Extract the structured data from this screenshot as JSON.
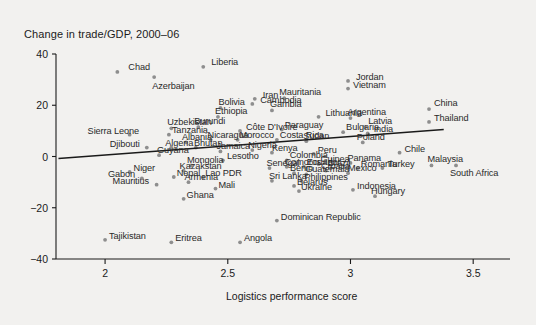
{
  "chart_data": {
    "type": "scatter",
    "title": "Change in trade/GDP, 2000–06",
    "xlabel": "Logistics performance score",
    "ylabel": "Change in trade/GDP, 2000–06",
    "xlim": [
      1.8,
      3.65
    ],
    "ylim": [
      -40,
      40
    ],
    "grid": false,
    "legend": null,
    "xticks": [
      "2",
      "2.5",
      "3",
      "3.5"
    ],
    "xtick_values": [
      2,
      2.5,
      3,
      3.5
    ],
    "yticks": [
      "40",
      "20",
      "0",
      "−20",
      "−40"
    ],
    "ytick_values": [
      40,
      20,
      0,
      -20,
      -40
    ],
    "marker_color": "#8e8e8e",
    "trendline": {
      "x0": 1.81,
      "y0": -0.8,
      "x1": 3.38,
      "y1": 10.5,
      "color": "#1a1a1a"
    },
    "points": [
      {
        "label": "Chad",
        "x": 2.05,
        "y": 33.0,
        "lx": 11,
        "ly": -5
      },
      {
        "label": "Azerbaijan",
        "x": 2.2,
        "y": 31.0,
        "lx": -2,
        "ly": 9
      },
      {
        "label": "Liberia",
        "x": 2.4,
        "y": 35.0,
        "lx": 8,
        "ly": -5
      },
      {
        "label": "Iran",
        "x": 2.61,
        "y": 22.5,
        "lx": 8,
        "ly": -4
      },
      {
        "label": "Mauritania",
        "x": 2.73,
        "y": 22.8,
        "lx": -5,
        "ly": -6
      },
      {
        "label": "Cambodia",
        "x": 2.6,
        "y": 20.5,
        "lx": 8,
        "ly": -4
      },
      {
        "label": "Jordan",
        "x": 2.99,
        "y": 29.5,
        "lx": 8,
        "ly": -4
      },
      {
        "label": "Vietnam",
        "x": 2.99,
        "y": 26.5,
        "lx": 5,
        "ly": -4
      },
      {
        "label": "Bolivia",
        "x": 2.47,
        "y": 19.0,
        "lx": -2,
        "ly": -6
      },
      {
        "label": "Gambia",
        "x": 2.68,
        "y": 18.0,
        "lx": -2,
        "ly": -6
      },
      {
        "label": "Ethiopia",
        "x": 2.46,
        "y": 15.5,
        "lx": -3,
        "ly": -6
      },
      {
        "label": "Lithuania",
        "x": 2.87,
        "y": 15.5,
        "lx": 7,
        "ly": -4
      },
      {
        "label": "Argentina",
        "x": 3.0,
        "y": 15.0,
        "lx": -3,
        "ly": -6
      },
      {
        "label": "China",
        "x": 3.32,
        "y": 18.5,
        "lx": 5,
        "ly": -6
      },
      {
        "label": "Thailand",
        "x": 3.32,
        "y": 13.5,
        "lx": 5,
        "ly": -4
      },
      {
        "label": "Latvia",
        "x": 3.06,
        "y": 11.5,
        "lx": 3,
        "ly": -6
      },
      {
        "label": "Uzbekistan",
        "x": 2.27,
        "y": 11.0,
        "lx": -4,
        "ly": -6
      },
      {
        "label": "Burundi",
        "x": 2.38,
        "y": 11.5,
        "lx": -4,
        "ly": -6
      },
      {
        "label": "Côte D'Ivoire",
        "x": 2.55,
        "y": 10.0,
        "lx": 6,
        "ly": -4
      },
      {
        "label": "Paraguay",
        "x": 2.72,
        "y": 10.5,
        "lx": 3,
        "ly": -5
      },
      {
        "label": "Bulgaria",
        "x": 2.97,
        "y": 9.5,
        "lx": 3,
        "ly": -5
      },
      {
        "label": "India",
        "x": 3.07,
        "y": 9.0,
        "lx": 6,
        "ly": -4
      },
      {
        "label": "Sierra Leone",
        "x": 2.1,
        "y": 8.5,
        "lx": -42,
        "ly": -4
      },
      {
        "label": "Tanzania",
        "x": 2.26,
        "y": 8.5,
        "lx": 3,
        "ly": -5
      },
      {
        "label": "Nicaragua",
        "x": 2.43,
        "y": 6.5,
        "lx": -3,
        "ly": -5
      },
      {
        "label": "Morocco",
        "x": 2.54,
        "y": 6.5,
        "lx": 2,
        "ly": -5
      },
      {
        "label": "Costa Rica",
        "x": 2.7,
        "y": 6.5,
        "lx": 3,
        "ly": -5
      },
      {
        "label": "Sudan",
        "x": 2.82,
        "y": 6.0,
        "lx": -3,
        "ly": -5
      },
      {
        "label": "Poland",
        "x": 3.05,
        "y": 5.5,
        "lx": -6,
        "ly": -5
      },
      {
        "label": "Albania",
        "x": 2.33,
        "y": 5.5,
        "lx": -4,
        "ly": -5
      },
      {
        "label": "Algeria",
        "x": 2.27,
        "y": 3.5,
        "lx": -6,
        "ly": -5
      },
      {
        "label": "Bhutan",
        "x": 2.37,
        "y": 3.5,
        "lx": -2,
        "ly": -5
      },
      {
        "label": "Djibouti",
        "x": 2.17,
        "y": 3.5,
        "lx": -37,
        "ly": -4
      },
      {
        "label": "Jamaica",
        "x": 2.47,
        "y": 2.0,
        "lx": -4,
        "ly": -5
      },
      {
        "label": "Nigeria",
        "x": 2.6,
        "y": 2.5,
        "lx": -4,
        "ly": -5
      },
      {
        "label": "Kenya",
        "x": 2.68,
        "y": 1.5,
        "lx": 0,
        "ly": -5
      },
      {
        "label": "Peru",
        "x": 2.85,
        "y": 1.0,
        "lx": 4,
        "ly": -4
      },
      {
        "label": "Chile",
        "x": 3.2,
        "y": 1.5,
        "lx": 5,
        "ly": -4
      },
      {
        "label": "Guyana",
        "x": 2.22,
        "y": 0.5,
        "lx": -2,
        "ly": -5
      },
      {
        "label": "Lesotho",
        "x": 2.48,
        "y": -1.5,
        "lx": 4,
        "ly": -4
      },
      {
        "label": "Colombia",
        "x": 2.74,
        "y": -1.5,
        "lx": 3,
        "ly": -5
      },
      {
        "label": "Panama",
        "x": 3.0,
        "y": -2.5,
        "lx": -3,
        "ly": -5
      },
      {
        "label": "Guinea",
        "x": 2.87,
        "y": -3.0,
        "lx": 2,
        "ly": -5
      },
      {
        "label": "Brazil",
        "x": 2.92,
        "y": -4.5,
        "lx": -3,
        "ly": -5
      },
      {
        "label": "Romania",
        "x": 3.03,
        "y": -4.5,
        "lx": 3,
        "ly": -4
      },
      {
        "label": "Turkey",
        "x": 3.13,
        "y": -4.5,
        "lx": 5,
        "ly": -4
      },
      {
        "label": "Malaysia",
        "x": 3.33,
        "y": -3.5,
        "lx": -4,
        "ly": -6
      },
      {
        "label": "South Africa",
        "x": 3.43,
        "y": -3.5,
        "lx": -6,
        "ly": 8
      },
      {
        "label": "Mongolia",
        "x": 2.35,
        "y": -3.5,
        "lx": -4,
        "ly": -5
      },
      {
        "label": "Ecuador",
        "x": 2.81,
        "y": -4.0,
        "lx": 3,
        "ly": -5
      },
      {
        "label": "Comoros",
        "x": 2.74,
        "y": -4.0,
        "lx": -2,
        "ly": -5
      },
      {
        "label": "Senegal",
        "x": 2.67,
        "y": -4.5,
        "lx": -3,
        "ly": -5
      },
      {
        "label": "Croatia",
        "x": 2.9,
        "y": -5.5,
        "lx": -5,
        "ly": -5
      },
      {
        "label": "Mexico",
        "x": 2.99,
        "y": -6.5,
        "lx": 0,
        "ly": -5
      },
      {
        "label": "Niger",
        "x": 2.1,
        "y": -6.0,
        "lx": 4,
        "ly": -4
      },
      {
        "label": "Kazakstan",
        "x": 2.32,
        "y": -5.5,
        "lx": -4,
        "ly": -5
      },
      {
        "label": "Benin",
        "x": 2.77,
        "y": -6.5,
        "lx": -4,
        "ly": -5
      },
      {
        "label": "Guatemala",
        "x": 2.82,
        "y": -7.0,
        "lx": -1,
        "ly": -5
      },
      {
        "label": "Nepal",
        "x": 2.28,
        "y": -8.0,
        "lx": 3,
        "ly": -4
      },
      {
        "label": "Lao PDR",
        "x": 2.4,
        "y": -8.0,
        "lx": 2,
        "ly": -4
      },
      {
        "label": "Gabon",
        "x": 2.15,
        "y": -8.5,
        "lx": -34,
        "ly": -4
      },
      {
        "label": "Philippines",
        "x": 2.8,
        "y": -9.5,
        "lx": 3,
        "ly": -4
      },
      {
        "label": "Armenia",
        "x": 2.34,
        "y": -10.0,
        "lx": -4,
        "ly": -5
      },
      {
        "label": "Sri Lanka",
        "x": 2.68,
        "y": -9.5,
        "lx": -3,
        "ly": -5
      },
      {
        "label": "Mauritius",
        "x": 2.21,
        "y": -11.0,
        "lx": -44,
        "ly": -4
      },
      {
        "label": "Belarus",
        "x": 2.77,
        "y": -11.5,
        "lx": 3,
        "ly": -4
      },
      {
        "label": "Mali",
        "x": 2.45,
        "y": -12.5,
        "lx": 3,
        "ly": -4
      },
      {
        "label": "Ukraine",
        "x": 2.79,
        "y": -13.5,
        "lx": 2,
        "ly": -4
      },
      {
        "label": "Indonesia",
        "x": 3.01,
        "y": -13.0,
        "lx": 4,
        "ly": -4
      },
      {
        "label": "Hungary",
        "x": 3.1,
        "y": -15.5,
        "lx": -4,
        "ly": -5
      },
      {
        "label": "Ghana",
        "x": 2.32,
        "y": -16.5,
        "lx": 3,
        "ly": -4
      },
      {
        "label": "Dominican Republic",
        "x": 2.7,
        "y": -25.0,
        "lx": 4,
        "ly": -4
      },
      {
        "label": "Tajikistan",
        "x": 2.0,
        "y": -32.5,
        "lx": 4,
        "ly": -4
      },
      {
        "label": "Eritrea",
        "x": 2.27,
        "y": -33.5,
        "lx": 4,
        "ly": -4
      },
      {
        "label": "Angola",
        "x": 2.55,
        "y": -33.5,
        "lx": 4,
        "ly": -4
      }
    ]
  }
}
